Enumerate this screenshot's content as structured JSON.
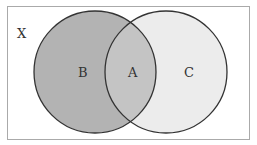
{
  "diagram": {
    "type": "venn",
    "universe_label": "X",
    "regions": [
      {
        "id": "B",
        "label": "B",
        "description": "left circle only"
      },
      {
        "id": "A",
        "label": "A",
        "description": "intersection of both circles"
      },
      {
        "id": "C",
        "label": "C",
        "description": "right circle only"
      }
    ],
    "colors": {
      "left_circle_fill": "#b3b3b3",
      "overlap_fill": "#c4c4c4",
      "right_circle_fill": "#ececec",
      "stroke": "#333333",
      "border": "#aaaaaa"
    }
  }
}
